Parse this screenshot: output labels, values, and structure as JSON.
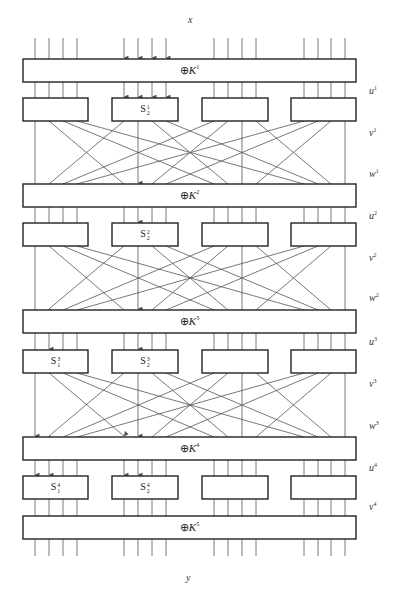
{
  "labels": {
    "input": "x",
    "output": "y"
  },
  "geometry": {
    "box_x_left": 23,
    "box_x_right": 356,
    "sbox_x": [
      [
        23,
        88
      ],
      [
        112,
        178
      ],
      [
        202,
        268
      ],
      [
        291,
        356
      ]
    ],
    "bit_x": [
      [
        35,
        49,
        63,
        77
      ],
      [
        124,
        138,
        152,
        166
      ],
      [
        214,
        228,
        242,
        256
      ],
      [
        304,
        318,
        331,
        345
      ]
    ],
    "input_top": 38,
    "output_bottom": 556
  },
  "xor_layers": [
    {
      "key": "1",
      "label": "K",
      "top": 59,
      "bottom": 82
    },
    {
      "key": "2",
      "label": "K",
      "top": 184,
      "bottom": 207
    },
    {
      "key": "3",
      "label": "K",
      "top": 310,
      "bottom": 333
    },
    {
      "key": "4",
      "label": "K",
      "top": 437,
      "bottom": 460
    },
    {
      "key": "5",
      "label": "K",
      "top": 516,
      "bottom": 539
    }
  ],
  "sbox_rows": [
    {
      "round": "1",
      "top": 98,
      "bottom": 121,
      "boxes": [
        {
          "label": ""
        },
        {
          "label": "S",
          "sup": "1",
          "sub": "2"
        },
        {
          "label": ""
        },
        {
          "label": ""
        }
      ]
    },
    {
      "round": "2",
      "top": 223,
      "bottom": 246,
      "boxes": [
        {
          "label": ""
        },
        {
          "label": "S",
          "sup": "2",
          "sub": "2"
        },
        {
          "label": ""
        },
        {
          "label": ""
        }
      ]
    },
    {
      "round": "3",
      "top": 350,
      "bottom": 373,
      "boxes": [
        {
          "label": "S",
          "sup": "3",
          "sub": "1"
        },
        {
          "label": "S",
          "sup": "3",
          "sub": "2"
        },
        {
          "label": ""
        },
        {
          "label": ""
        }
      ]
    },
    {
      "round": "4",
      "top": 476,
      "bottom": 499,
      "boxes": [
        {
          "label": "S",
          "sup": "4",
          "sub": "1"
        },
        {
          "label": "S",
          "sup": "4",
          "sub": "2"
        },
        {
          "label": ""
        },
        {
          "label": ""
        }
      ]
    }
  ],
  "side_labels": [
    {
      "text": "u",
      "sup": "1",
      "y": 91
    },
    {
      "text": "v",
      "sup": "1",
      "y": 133
    },
    {
      "text": "w",
      "sup": "1",
      "y": 174
    },
    {
      "text": "u",
      "sup": "2",
      "y": 216
    },
    {
      "text": "v",
      "sup": "2",
      "y": 258
    },
    {
      "text": "w",
      "sup": "2",
      "y": 298
    },
    {
      "text": "u",
      "sup": "3",
      "y": 342
    },
    {
      "text": "v",
      "sup": "3",
      "y": 384
    },
    {
      "text": "w",
      "sup": "3",
      "y": 426
    },
    {
      "text": "u",
      "sup": "4",
      "y": 468
    },
    {
      "text": "v",
      "sup": "4",
      "y": 507
    }
  ],
  "arrows": {
    "input": [
      [
        1,
        0
      ],
      [
        1,
        1
      ],
      [
        1,
        2
      ],
      [
        1,
        3
      ]
    ],
    "u1": [
      [
        1,
        0
      ],
      [
        1,
        1
      ],
      [
        1,
        2
      ],
      [
        1,
        3
      ]
    ],
    "w1": [
      [
        1,
        1
      ]
    ],
    "u2": [
      [
        1,
        1
      ]
    ],
    "w2": [
      [
        0,
        1
      ],
      [
        1,
        1
      ]
    ],
    "u3": [
      [
        0,
        1
      ],
      [
        1,
        1
      ]
    ],
    "w3": [
      [
        0,
        0
      ],
      [
        1,
        0
      ],
      [
        0,
        1
      ],
      [
        1,
        1
      ]
    ],
    "u4": [
      [
        0,
        0
      ],
      [
        0,
        1
      ],
      [
        1,
        0
      ],
      [
        1,
        1
      ]
    ]
  },
  "colors": {
    "line": "#555555",
    "box_border": "#222222",
    "background": "#ffffff"
  },
  "permutation": "transpose: output bit i of S-box j -> input bit j of S-box i"
}
